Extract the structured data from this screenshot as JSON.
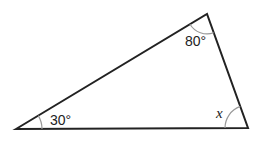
{
  "diagram": {
    "type": "triangle",
    "vertices": {
      "left": {
        "x": 16,
        "y": 129
      },
      "top": {
        "x": 207,
        "y": 14
      },
      "right": {
        "x": 248,
        "y": 128
      }
    },
    "angles": [
      {
        "vertex": "left",
        "label": "30°"
      },
      {
        "vertex": "top",
        "label": "80°"
      },
      {
        "vertex": "right",
        "label": "x"
      }
    ],
    "colors": {
      "line": "#222222",
      "arc": "#999999"
    }
  }
}
